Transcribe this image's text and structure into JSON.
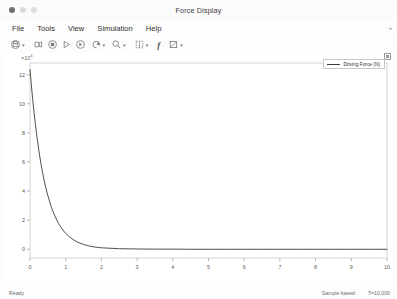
{
  "window": {
    "title": "Force Display",
    "controls": {
      "close": "close",
      "minimize": "minimize",
      "maximize": "maximize"
    }
  },
  "menubar": {
    "items": [
      {
        "label": "File",
        "name": "menu-file"
      },
      {
        "label": "Tools",
        "name": "menu-tools"
      },
      {
        "label": "View",
        "name": "menu-view"
      },
      {
        "label": "Simulation",
        "name": "menu-simulation"
      },
      {
        "label": "Help",
        "name": "menu-help"
      }
    ],
    "overflow_label": "»"
  },
  "toolbar": {
    "items": [
      {
        "name": "print-icon",
        "caret": true
      },
      {
        "name": "configuration-icon",
        "caret": false
      },
      {
        "name": "stop-icon",
        "caret": false
      },
      {
        "name": "run-icon",
        "caret": false
      },
      {
        "name": "step-forward-icon",
        "caret": false
      },
      {
        "name": "restore-view-icon",
        "caret": true
      },
      {
        "name": "zoom-icon",
        "caret": true
      },
      {
        "name": "cursor-measurement-icon",
        "caret": true
      },
      {
        "name": "signal-statistics-icon",
        "caret": false
      },
      {
        "name": "style-icon",
        "caret": true
      }
    ]
  },
  "plot": {
    "exponent_label": "×10",
    "exponent_power": "4",
    "maximize_axes_label": "maximize-axes",
    "legend": {
      "entries": [
        {
          "label": "Driving Force (N)",
          "color": "#3b3b3b"
        }
      ]
    }
  },
  "statusbar": {
    "left": "Ready",
    "mode": "Sample based",
    "time": "T=10.000"
  },
  "chart_data": {
    "type": "line",
    "title": "",
    "xlabel": "",
    "ylabel": "",
    "yscale_exponent": 4,
    "xlim": [
      0,
      10
    ],
    "ylim": [
      -0.6,
      12.8
    ],
    "xticks": [
      0,
      1,
      2,
      3,
      4,
      5,
      6,
      7,
      8,
      9,
      10
    ],
    "yticks": [
      0,
      2,
      4,
      6,
      8,
      10,
      12
    ],
    "xticklabels": [
      "0",
      "1",
      "2",
      "3",
      "4",
      "5",
      "6",
      "7",
      "8",
      "9",
      "10"
    ],
    "yticklabels": [
      "0",
      "2",
      "4",
      "6",
      "8",
      "10",
      "12"
    ],
    "grid": false,
    "legend_position": "upper right",
    "series": [
      {
        "name": "Driving Force (N)",
        "color": "#3b3b3b",
        "linewidth": 0.9,
        "x": [
          0,
          0.05,
          0.1,
          0.15,
          0.2,
          0.25,
          0.3,
          0.35,
          0.4,
          0.45,
          0.5,
          0.55,
          0.6,
          0.65,
          0.7,
          0.75,
          0.8,
          0.85,
          0.9,
          0.95,
          1.0,
          1.1,
          1.2,
          1.3,
          1.4,
          1.5,
          1.6,
          1.7,
          1.8,
          1.9,
          2.0,
          2.5,
          3.0,
          3.5,
          4.0,
          4.5,
          5.0,
          5.5,
          6.0,
          6.5,
          7.0,
          7.5,
          8.0,
          8.5,
          9.0,
          9.5,
          10.0
        ],
        "y": [
          12.35,
          10.95,
          9.7,
          8.6,
          7.62,
          6.75,
          5.98,
          5.3,
          4.69,
          4.16,
          3.69,
          3.27,
          2.89,
          2.56,
          2.27,
          2.01,
          1.78,
          1.58,
          1.4,
          1.24,
          1.1,
          0.86,
          0.68,
          0.53,
          0.42,
          0.33,
          0.26,
          0.2,
          0.16,
          0.13,
          0.1,
          0.04,
          0.02,
          0.01,
          0.01,
          0.0,
          0.0,
          0.0,
          0.0,
          0.0,
          0.0,
          0.0,
          0.0,
          0.0,
          0.0,
          0.0,
          0.0
        ]
      }
    ]
  }
}
